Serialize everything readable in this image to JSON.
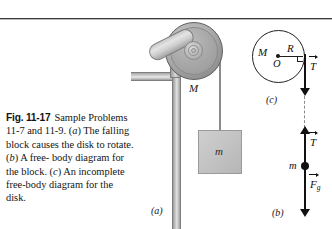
{
  "figure": {
    "number": "Fig. 11-17",
    "caption_text": "Sample Problems 11-7 and 11-9. (a) The falling block causes the disk to rotate. (b) A free-body diagram for the block. (c) An incomplete free-body diagram for the disk.",
    "caption_parts": {
      "lead": "Sample Problems",
      "line2_a": "11-7 and 11-9. (",
      "line2_italic": "a",
      "line2_b": ") The",
      "line3": "falling block causes the",
      "line4_a": "disk to rotate. (",
      "line4_italic": "b",
      "line4_b": ") A free-",
      "line5": "body diagram for the block.",
      "line6_a": "(",
      "line6_italic": "c",
      "line6_b": ") An incomplete free-body",
      "line7": "diagram for the disk."
    }
  },
  "part_a": {
    "label": "(a)",
    "disk_label": "M",
    "block_label": "m",
    "description": "Apparatus: a disk of mass M mounted on an axle attached to an L-shaped bracket, with a cord over the disk rim supporting a hanging block of mass m."
  },
  "part_b": {
    "label": "(b)",
    "body_label": "m",
    "tension_label": "T",
    "gravity_label": "F",
    "gravity_subscript": "g",
    "description": "Free-body diagram of the block: tension T upward, gravitational force F_g downward."
  },
  "part_c": {
    "label": "(c)",
    "disk_mass_label": "M",
    "center_label": "O",
    "radius_label": "R",
    "tension_label": "T",
    "description": "Incomplete free-body diagram of the disk: radius R from center O to the rim where tension T acts downward."
  },
  "colors": {
    "ink": "#111111",
    "rule": "#3c3c3c",
    "metal_light": "#e2e2e2",
    "metal_mid": "#b8b8b8",
    "metal_dark": "#8f8f8f",
    "block_fill": "#c3c3c3"
  }
}
